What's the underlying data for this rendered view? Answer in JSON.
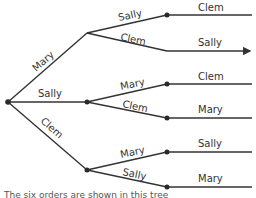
{
  "diagram": {
    "type": "tree",
    "colors": {
      "line": "#333333",
      "node": "#2a2a2a",
      "text": "#333333",
      "background": "#ffffff"
    },
    "root": {
      "label": ""
    },
    "level1": [
      {
        "label": "Mary",
        "children": [
          {
            "edge": "Sally",
            "leaf": "Clem"
          },
          {
            "edge": "Clem",
            "leaf": "Sally"
          }
        ]
      },
      {
        "label": "Sally",
        "children": [
          {
            "edge": "Mary",
            "leaf": "Clem"
          },
          {
            "edge": "Clem",
            "leaf": "Mary"
          }
        ]
      },
      {
        "label": "Clem",
        "children": [
          {
            "edge": "Mary",
            "leaf": "Sally"
          },
          {
            "edge": "Sally",
            "leaf": "Mary"
          }
        ]
      }
    ],
    "caption": "The six orders are shown in this tree"
  }
}
